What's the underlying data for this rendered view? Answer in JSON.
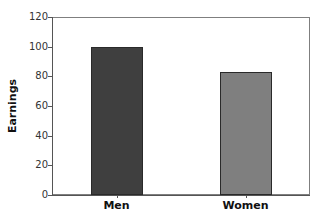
{
  "chart_data": {
    "type": "bar",
    "title": "",
    "xlabel": "",
    "ylabel": "Earnings",
    "categories": [
      "Men",
      "Women"
    ],
    "values": [
      100,
      83
    ],
    "colors": [
      "#3f3f3f",
      "#7f7f7f"
    ],
    "ylim": [
      0,
      120
    ],
    "yticks": [
      0,
      20,
      40,
      60,
      80,
      100,
      120
    ],
    "yticklabels": [
      "0",
      "20",
      "40",
      "60",
      "80",
      "100",
      "120"
    ],
    "grid": false,
    "legend": false
  }
}
